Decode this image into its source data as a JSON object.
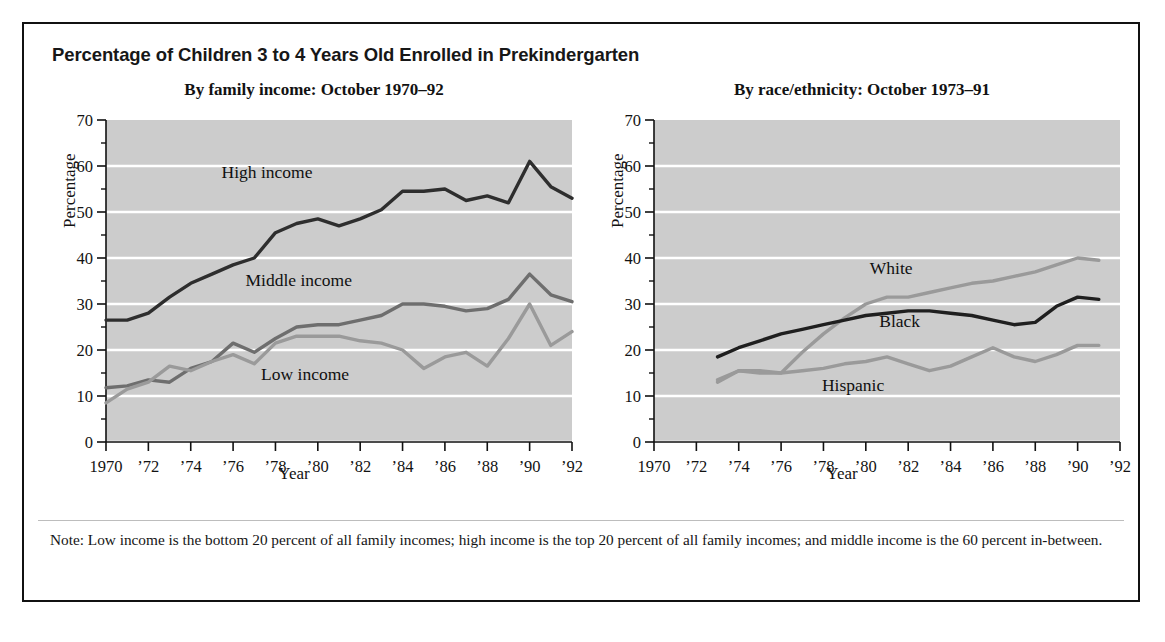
{
  "figure": {
    "title": "Percentage of Children 3 to 4 Years Old Enrolled in Prekindergarten",
    "note": "Note: Low income is the bottom 20 percent of all family incomes; high income is the top 20 percent of all family incomes; and middle income is the 60 percent in-between."
  },
  "chart_data": [
    {
      "type": "line",
      "title": "By family income: October 1970–92",
      "xlabel": "Year",
      "ylabel": "Percentage",
      "ylim": [
        0,
        70
      ],
      "yticks": [
        0,
        10,
        20,
        30,
        40,
        50,
        60,
        70
      ],
      "minor_yticks": [
        5,
        15,
        25,
        35,
        45,
        55,
        65
      ],
      "xlim": [
        1970,
        1992
      ],
      "xticks": [
        1970,
        1972,
        1974,
        1976,
        1978,
        1980,
        1982,
        1984,
        1986,
        1988,
        1990,
        1992
      ],
      "xticklabels": [
        "1970",
        "’72",
        "’74",
        "’76",
        "’78",
        "’80",
        "’82",
        "’84",
        "’86",
        "’88",
        "’90",
        "’92"
      ],
      "grid": "horizontal-white",
      "plot_background": "#cccccc",
      "legend": "inline-labels",
      "x": [
        1970,
        1971,
        1972,
        1973,
        1974,
        1975,
        1976,
        1977,
        1978,
        1979,
        1980,
        1981,
        1982,
        1983,
        1984,
        1985,
        1986,
        1987,
        1988,
        1989,
        1990,
        1991,
        1992
      ],
      "series": [
        {
          "name": "High income",
          "color": "#2e2e2e",
          "label_x": 1977.6,
          "label_y": 57.5,
          "values": [
            26.5,
            26.5,
            28.0,
            31.5,
            34.5,
            36.5,
            38.5,
            40.0,
            45.5,
            47.5,
            48.5,
            47.0,
            48.5,
            50.5,
            54.5,
            54.5,
            55.0,
            52.5,
            53.5,
            52.0,
            61.0,
            55.5,
            53.0
          ]
        },
        {
          "name": "Middle income",
          "color": "#6e6e6e",
          "label_x": 1979.1,
          "label_y": 34.0,
          "values": [
            11.8,
            12.2,
            13.5,
            13.0,
            16.0,
            17.5,
            21.5,
            19.5,
            22.5,
            25.0,
            25.5,
            25.5,
            26.5,
            27.5,
            30.0,
            30.0,
            29.5,
            28.5,
            29.0,
            31.0,
            36.5,
            32.0,
            30.5
          ]
        },
        {
          "name": "Low income",
          "color": "#9a9a9a",
          "label_x": 1979.4,
          "label_y": 13.5,
          "values": [
            8.5,
            11.5,
            13.0,
            16.5,
            15.5,
            17.5,
            19.0,
            17.0,
            21.5,
            23.0,
            23.0,
            23.0,
            22.0,
            21.5,
            20.0,
            16.0,
            18.5,
            19.5,
            16.5,
            22.5,
            30.0,
            21.0,
            24.0
          ]
        }
      ]
    },
    {
      "type": "line",
      "title": "By race/ethnicity: October 1973–91",
      "xlabel": "Year",
      "ylabel": "Percentage",
      "ylim": [
        0,
        70
      ],
      "yticks": [
        0,
        10,
        20,
        30,
        40,
        50,
        60,
        70
      ],
      "minor_yticks": [
        5,
        15,
        25,
        35,
        45,
        55,
        65
      ],
      "xlim": [
        1970,
        1992
      ],
      "xticks": [
        1970,
        1972,
        1974,
        1976,
        1978,
        1980,
        1982,
        1984,
        1986,
        1988,
        1990,
        1992
      ],
      "xticklabels": [
        "1970",
        "’72",
        "’74",
        "’76",
        "’78",
        "’80",
        "’82",
        "’84",
        "’86",
        "’88",
        "’90",
        "’92"
      ],
      "grid": "horizontal-white",
      "plot_background": "#cccccc",
      "legend": "inline-labels",
      "x": [
        1973,
        1974,
        1975,
        1976,
        1977,
        1978,
        1979,
        1980,
        1981,
        1982,
        1983,
        1984,
        1985,
        1986,
        1987,
        1988,
        1989,
        1990,
        1991
      ],
      "series": [
        {
          "name": "White",
          "color": "#9a9a9a",
          "label_x": 1981.2,
          "label_y": 36.5,
          "values": [
            13.5,
            15.5,
            15.5,
            15.0,
            19.5,
            23.5,
            27.0,
            30.0,
            31.5,
            31.5,
            32.5,
            33.5,
            34.5,
            35.0,
            36.0,
            37.0,
            38.5,
            40.0,
            39.5
          ]
        },
        {
          "name": "Black",
          "color": "#1f1f1f",
          "label_x": 1981.6,
          "label_y": 25.0,
          "values": [
            18.5,
            20.5,
            22.0,
            23.5,
            24.5,
            25.5,
            26.5,
            27.5,
            28.0,
            28.5,
            28.5,
            28.0,
            27.5,
            26.5,
            25.5,
            26.0,
            29.5,
            31.5,
            31.0
          ]
        },
        {
          "name": "Hispanic",
          "color": "#9a9a9a",
          "label_x": 1979.4,
          "label_y": 11.0,
          "values": [
            13.0,
            15.5,
            15.0,
            15.0,
            15.5,
            16.0,
            17.0,
            17.5,
            18.5,
            17.0,
            15.5,
            16.5,
            18.5,
            20.5,
            18.5,
            17.5,
            19.0,
            21.0,
            21.0
          ]
        }
      ]
    }
  ]
}
